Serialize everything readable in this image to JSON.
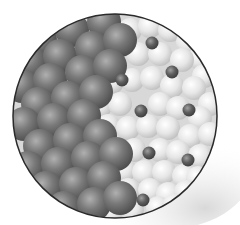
{
  "image": {
    "description": "Circular magnified illustration of packed spheres: dark grey spheres in a close-packed lattice on the left, light grey/white spheres on the right interspersed with small dark spheres",
    "circle": {
      "cx": 115,
      "cy": 116,
      "r": 102
    },
    "colors": {
      "background": "#ffffff",
      "outline": "#2a2a2a",
      "dark_sphere": "#6e6e6e",
      "dark_sphere_highlight": "#a8a8a8",
      "dark_sphere_shadow": "#4a4a4a",
      "light_sphere": "#e4e4e4",
      "light_sphere_highlight": "#ffffff",
      "light_sphere_shadow": "#c2c2c2",
      "dopant": "#5a5a5a",
      "dopant_highlight": "#9a9a9a"
    },
    "dark_spheres": [
      [
        40,
        40
      ],
      [
        72,
        30
      ],
      [
        104,
        22
      ],
      [
        30,
        62
      ],
      [
        60,
        56
      ],
      [
        92,
        48
      ],
      [
        120,
        40
      ],
      [
        22,
        86
      ],
      [
        50,
        80
      ],
      [
        82,
        72
      ],
      [
        110,
        66
      ],
      [
        38,
        104
      ],
      [
        68,
        98
      ],
      [
        96,
        92
      ],
      [
        24,
        124
      ],
      [
        54,
        120
      ],
      [
        84,
        116
      ],
      [
        40,
        146
      ],
      [
        70,
        140
      ],
      [
        100,
        136
      ],
      [
        28,
        168
      ],
      [
        58,
        164
      ],
      [
        88,
        158
      ],
      [
        116,
        154
      ],
      [
        46,
        188
      ],
      [
        76,
        184
      ],
      [
        104,
        178
      ],
      [
        64,
        208
      ],
      [
        94,
        204
      ],
      [
        120,
        198
      ]
    ],
    "light_spheres": [
      [
        130,
        30
      ],
      [
        150,
        26
      ],
      [
        170,
        30
      ],
      [
        188,
        42
      ],
      [
        200,
        58
      ],
      [
        138,
        54
      ],
      [
        160,
        54
      ],
      [
        182,
        60
      ],
      [
        204,
        76
      ],
      [
        112,
        82
      ],
      [
        132,
        80
      ],
      [
        152,
        78
      ],
      [
        172,
        86
      ],
      [
        194,
        88
      ],
      [
        210,
        104
      ],
      [
        100,
        106
      ],
      [
        120,
        104
      ],
      [
        160,
        104
      ],
      [
        178,
        108
      ],
      [
        200,
        118
      ],
      [
        108,
        126
      ],
      [
        128,
        128
      ],
      [
        148,
        126
      ],
      [
        168,
        128
      ],
      [
        190,
        136
      ],
      [
        210,
        134
      ],
      [
        114,
        148
      ],
      [
        134,
        150
      ],
      [
        160,
        150
      ],
      [
        178,
        152
      ],
      [
        200,
        156
      ],
      [
        124,
        170
      ],
      [
        144,
        172
      ],
      [
        164,
        172
      ],
      [
        184,
        176
      ],
      [
        198,
        178
      ],
      [
        128,
        190
      ],
      [
        150,
        190
      ],
      [
        168,
        194
      ],
      [
        186,
        192
      ],
      [
        112,
        212
      ],
      [
        132,
        210
      ],
      [
        158,
        208
      ],
      [
        174,
        206
      ]
    ],
    "dopants": [
      [
        152,
        43
      ],
      [
        172,
        72
      ],
      [
        122,
        80
      ],
      [
        141,
        111
      ],
      [
        189,
        110
      ],
      [
        149,
        153
      ],
      [
        188,
        160
      ],
      [
        143,
        200
      ]
    ]
  }
}
